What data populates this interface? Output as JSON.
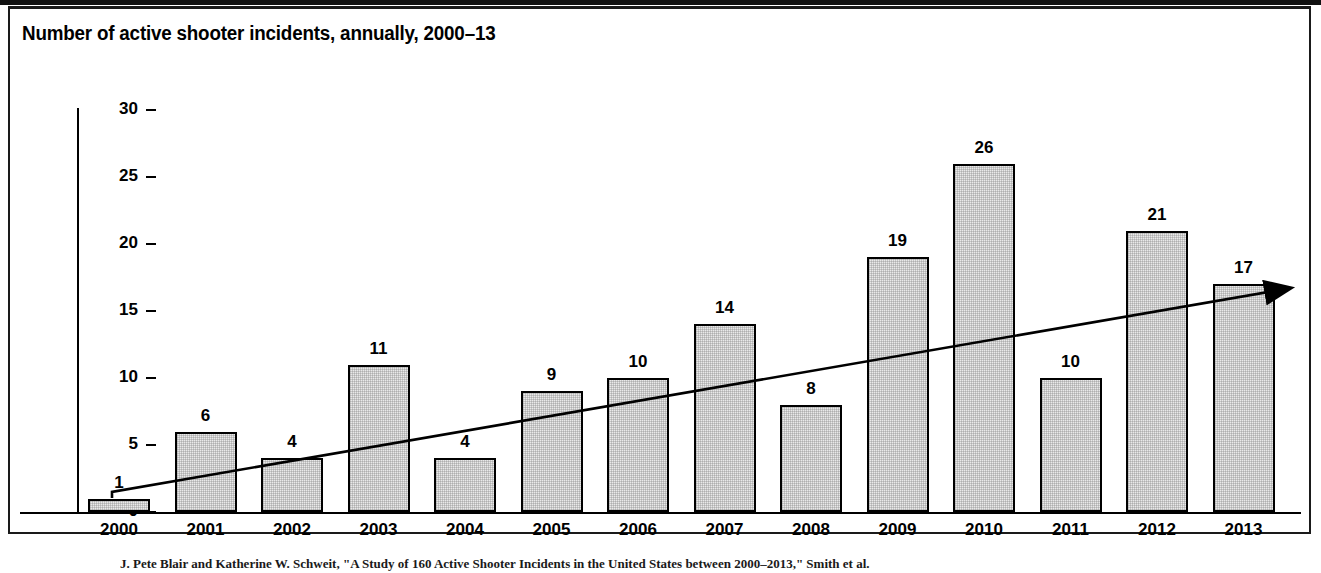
{
  "figure": {
    "title": "Number of active shooter incidents, annually, 2000–13",
    "source_caption": "J. Pete Blair and Katherine W. Schweit, \"A Study of 160 Active Shooter Incidents in the United States between 2000–2013,\" Smith et al."
  },
  "colors": {
    "bar_fill": "#e9e9e9",
    "bar_stroke": "#000000",
    "axis": "#000000",
    "frame": "#1a1a1a",
    "trend": "#000000"
  },
  "chart_data": {
    "type": "bar",
    "title": "Number of active shooter incidents, annually, 2000–13",
    "xlabel": "",
    "ylabel": "",
    "categories": [
      "2000",
      "2001",
      "2002",
      "2003",
      "2004",
      "2005",
      "2006",
      "2007",
      "2008",
      "2009",
      "2010",
      "2011",
      "2012",
      "2013"
    ],
    "values": [
      1,
      6,
      4,
      11,
      4,
      9,
      10,
      14,
      8,
      19,
      26,
      10,
      21,
      17
    ],
    "data_labels": [
      "1",
      "6",
      "4",
      "11",
      "4",
      "9",
      "10",
      "14",
      "8",
      "19",
      "26",
      "10",
      "21",
      "17"
    ],
    "ylim": [
      0,
      30
    ],
    "yticks": [
      0,
      5,
      10,
      15,
      20,
      25,
      30
    ],
    "ytick_labels": [
      "0",
      "5",
      "10",
      "15",
      "20",
      "25",
      "30"
    ],
    "grid": false,
    "legend": "none",
    "annotations": [
      {
        "name": "trend-arrow",
        "kind": "arrow",
        "description": "Upward trend arrow from 2000 to beyond 2013",
        "start_value": 1.5,
        "end_value": 16.7
      }
    ]
  }
}
